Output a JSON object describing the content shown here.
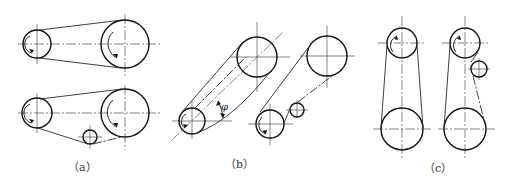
{
  "figure": {
    "panels": [
      {
        "id": "a",
        "caption": "（a）",
        "layouts": [
          {
            "name": "horizontal-open-belt",
            "pulleys": [
              {
                "role": "driver-small",
                "cx": 37,
                "cy": 44,
                "r": 14
              },
              {
                "role": "driven-large",
                "cx": 125,
                "cy": 44,
                "r": 24
              }
            ],
            "idler": null
          },
          {
            "name": "horizontal-belt-with-idler",
            "pulleys": [
              {
                "role": "driver-small",
                "cx": 37,
                "cy": 113,
                "r": 15
              },
              {
                "role": "driven-large",
                "cx": 125,
                "cy": 113,
                "r": 24
              }
            ],
            "idler": {
              "cx": 90,
              "cy": 137,
              "r": 7
            }
          }
        ]
      },
      {
        "id": "b",
        "caption": "（b）",
        "angle_label": "φ",
        "layouts": [
          {
            "name": "inclined-belt",
            "pulleys": [
              {
                "role": "small",
                "cx": 192,
                "cy": 121,
                "r": 13
              },
              {
                "role": "large",
                "cx": 257,
                "cy": 57,
                "r": 20
              }
            ],
            "idler": null
          },
          {
            "name": "inclined-belt-with-idler",
            "pulleys": [
              {
                "role": "large",
                "cx": 327,
                "cy": 56,
                "r": 20
              },
              {
                "role": "small",
                "cx": 270,
                "cy": 124,
                "r": 14
              }
            ],
            "idler": {
              "cx": 297,
              "cy": 110,
              "r": 7
            }
          }
        ]
      },
      {
        "id": "c",
        "caption": "（c）",
        "layouts": [
          {
            "name": "vertical-belt",
            "pulleys": [
              {
                "role": "top-small",
                "cx": 402,
                "cy": 43,
                "r": 15
              },
              {
                "role": "bottom-large",
                "cx": 402,
                "cy": 129,
                "r": 21
              }
            ],
            "idler": null
          },
          {
            "name": "vertical-belt-with-idler",
            "pulleys": [
              {
                "role": "top-small",
                "cx": 465,
                "cy": 43,
                "r": 15
              },
              {
                "role": "bottom-large",
                "cx": 465,
                "cy": 129,
                "r": 21
              }
            ],
            "idler": {
              "cx": 479,
              "cy": 69,
              "r": 8
            }
          }
        ]
      }
    ]
  }
}
